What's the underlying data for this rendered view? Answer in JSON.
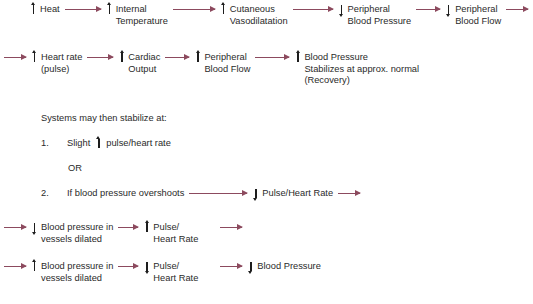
{
  "diagram": {
    "title_text": "Physiological response flow to heat",
    "colors": {
      "arrow": "#8c4a5e",
      "text": "#2a2a2a",
      "glyph": "#1d1d1d",
      "background": "#ffffff"
    },
    "rows": [
      {
        "id": "row-heat-cascade",
        "leading_arrow": false,
        "trailing_arrow": true,
        "nodes": [
          {
            "dir": "up",
            "lines": [
              "Heat"
            ]
          },
          {
            "dir": "up",
            "lines": [
              "Internal",
              "Temperature"
            ]
          },
          {
            "dir": "up",
            "lines": [
              "Cutaneous",
              "Vasodilatation"
            ]
          },
          {
            "dir": "down",
            "lines": [
              "Peripheral",
              "Blood Pressure"
            ]
          },
          {
            "dir": "down",
            "lines": [
              "Peripheral",
              "Blood Flow"
            ]
          }
        ]
      },
      {
        "id": "row-recovery-cascade",
        "leading_arrow": true,
        "trailing_arrow": false,
        "nodes": [
          {
            "dir": "up",
            "lines": [
              "Heart rate",
              "(pulse)"
            ]
          },
          {
            "dir": "up",
            "lines": [
              "Cardiac",
              "Output"
            ]
          },
          {
            "dir": "up",
            "lines": [
              "Peripheral",
              "Blood Flow"
            ]
          },
          {
            "dir": "up",
            "lines": [
              "Blood Pressure",
              "Stabilizes at approx. normal",
              "(Recovery)"
            ]
          }
        ]
      }
    ],
    "stabilize_heading": "Systems may then stabilize at:",
    "item1": {
      "number": "1.",
      "prefix": "Slight",
      "dir": "up",
      "label": "pulse/heart rate"
    },
    "or_label": "OR",
    "item2": {
      "number": "2.",
      "condition": "If blood pressure overshoots",
      "dir": "down",
      "label": "Pulse/Heart Rate"
    },
    "bottom_rows": [
      {
        "id": "row-dilated-a",
        "leading_arrow": true,
        "trailing_arrow": true,
        "nodes": [
          {
            "dir": "down",
            "lines": [
              "Blood pressure in",
              "vessels dilated"
            ]
          },
          {
            "dir": "up",
            "lines": [
              "Pulse/",
              "Heart Rate"
            ]
          }
        ]
      },
      {
        "id": "row-dilated-b",
        "leading_arrow": true,
        "trailing_arrow": false,
        "nodes": [
          {
            "dir": "up",
            "lines": [
              "Blood pressure in",
              "vessels dilated"
            ]
          },
          {
            "dir": "down",
            "lines": [
              "Pulse/",
              "Heart Rate"
            ]
          },
          {
            "dir": "down",
            "lines": [
              "Blood Pressure"
            ]
          }
        ]
      }
    ]
  }
}
